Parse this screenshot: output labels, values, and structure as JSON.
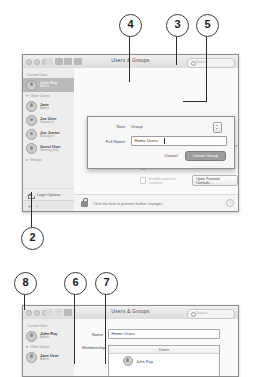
{
  "callouts": [
    {
      "id": "callout-4",
      "label": "4"
    },
    {
      "id": "callout-3",
      "label": "3"
    },
    {
      "id": "callout-5",
      "label": "5"
    },
    {
      "id": "callout-2",
      "label": "2"
    },
    {
      "id": "callout-8",
      "label": "8"
    },
    {
      "id": "callout-6",
      "label": "6"
    },
    {
      "id": "callout-7",
      "label": "7"
    }
  ],
  "top_window": {
    "title": "Users & Groups",
    "search_placeholder": "Search",
    "sidebar": {
      "current_user_header": "Current User",
      "current_user": {
        "name": "John Ray",
        "role": "Admin"
      },
      "other_users_header": "Other Users",
      "other_users": [
        {
          "name": "Jane",
          "role": "Admin"
        },
        {
          "name": "Joe User",
          "role": "Standard"
        },
        {
          "name": "Joe Junior",
          "role": "Managed"
        },
        {
          "name": "Guest User",
          "role": "Sharing only"
        }
      ],
      "groups_header": "Groups",
      "login_options": "Login Options",
      "add_button": "+",
      "remove_button": "−"
    },
    "detail": {
      "contacts_card_label": "Contacts Card:",
      "contacts_open_button": "Open...",
      "checkbox_reset_password": "Allow user to reset password using Apple ID",
      "checkbox_administer": "Allow user to administer this computer",
      "checkbox_parental": "Enable parental controls",
      "parental_button": "Open Parental Controls...",
      "password_button": "ent...",
      "help_icon": "?"
    },
    "lock_bar": {
      "text": "Click the lock to prevent further changes.",
      "icon": "lock-open-icon"
    }
  },
  "sheet": {
    "new_label": "New:",
    "new_value": "Group",
    "full_name_label": "Full Name:",
    "full_name_value": "Home Users",
    "cancel_button": "Cancel",
    "create_button": "Create Group"
  },
  "bottom_window": {
    "title": "Users & Groups",
    "search_placeholder": "Search",
    "sidebar": {
      "current_user_header": "Current User",
      "current_user": {
        "name": "John Ray",
        "role": "Admin"
      },
      "other_users_header": "Other Users",
      "other_users": [
        {
          "name": "Jane User",
          "role": "Admin"
        }
      ]
    },
    "detail": {
      "name_label": "Name:",
      "name_value": "Home Users",
      "membership_label": "Membership:",
      "membership_header": "Users",
      "members": [
        {
          "name": "John Ray"
        }
      ]
    }
  }
}
